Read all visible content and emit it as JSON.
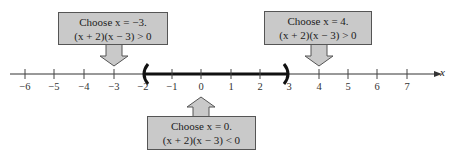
{
  "diagram": {
    "type": "number-line-sign-chart",
    "axis_variable": "x",
    "ticks": [
      -6,
      -5,
      -4,
      -3,
      -2,
      -1,
      0,
      1,
      2,
      3,
      4,
      5,
      6,
      7
    ],
    "tick_labels": [
      "−6",
      "−5",
      "−4",
      "−3",
      "−2",
      "−1",
      "0",
      "1",
      "2",
      "3",
      "4",
      "5",
      "6",
      "7"
    ],
    "solution_interval": {
      "left": -2,
      "right": 3,
      "left_open": true,
      "right_open": true
    },
    "callouts": [
      {
        "position": "top-left",
        "test_value": -3,
        "line1": "Choose x = −3.",
        "line2": "(x + 2)(x − 3) > 0"
      },
      {
        "position": "top-right",
        "test_value": 4,
        "line1": "Choose x = 4.",
        "line2": "(x + 2)(x − 3) > 0"
      },
      {
        "position": "bottom-center",
        "test_value": 0,
        "line1": "Choose x = 0.",
        "line2": "(x + 2)(x − 3) < 0"
      }
    ],
    "colors": {
      "callout_fill": "#c9c9c9",
      "line": "#222222"
    }
  }
}
